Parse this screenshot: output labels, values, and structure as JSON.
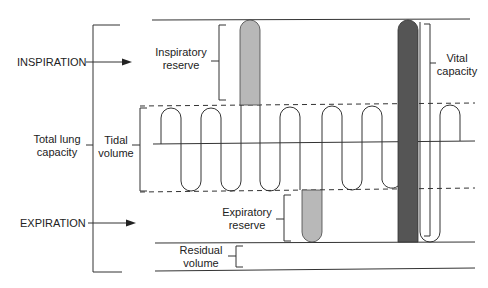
{
  "diagram": {
    "type": "spirogram",
    "labels": {
      "inspiration": "INSPIRATION",
      "expiration": "EXPIRATION",
      "total_lung_capacity_1": "Total lung",
      "total_lung_capacity_2": "capacity",
      "tidal_volume_1": "Tidal",
      "tidal_volume_2": "volume",
      "inspiratory_reserve_1": "Inspiratory",
      "inspiratory_reserve_2": "reserve",
      "expiratory_reserve_1": "Expiratory",
      "expiratory_reserve_2": "reserve",
      "vital_capacity_1": "Vital",
      "vital_capacity_2": "capacity",
      "residual_volume_1": "Residual",
      "residual_volume_2": "volume"
    },
    "colors": {
      "line": "#333333",
      "inspiratory_reserve_fill": "#b8b8b8",
      "expiratory_reserve_fill": "#b8b8b8",
      "vital_capacity_fill": "#555555"
    }
  }
}
